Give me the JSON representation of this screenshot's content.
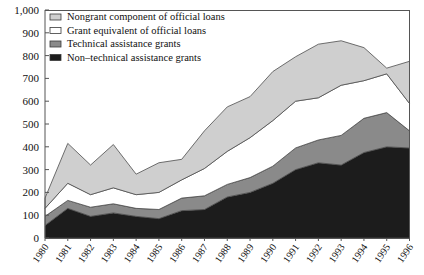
{
  "chart_data": {
    "type": "area",
    "stacked": true,
    "title": "",
    "subtitle": "",
    "xlabel": "",
    "ylabel": "",
    "grid": false,
    "legend_position": "top-left",
    "ylim": [
      0,
      1000
    ],
    "ytick_labels": [
      "1,000",
      "900",
      "800",
      "700",
      "600",
      "500",
      "400",
      "300",
      "200",
      "100",
      "0"
    ],
    "ytick_values": [
      1000,
      900,
      800,
      700,
      600,
      500,
      400,
      300,
      200,
      100,
      0
    ],
    "categories": [
      "1980",
      "1981",
      "1982",
      "1983",
      "1984",
      "1985",
      "1986",
      "1987",
      "1988",
      "1989",
      "1990",
      "1991",
      "1992",
      "1993",
      "1994",
      "1995",
      "1996"
    ],
    "x": [
      1980,
      1981,
      1982,
      1983,
      1984,
      1985,
      1986,
      1987,
      1988,
      1989,
      1990,
      1991,
      1992,
      1993,
      1994,
      1995,
      1996
    ],
    "series": [
      {
        "name": "Non-technical assistance grants",
        "color": "#1c1c1c",
        "values": [
          55,
          130,
          95,
          110,
          95,
          85,
          120,
          125,
          180,
          200,
          240,
          300,
          330,
          320,
          375,
          400,
          395
        ]
      },
      {
        "name": "Technical assistance grants",
        "color": "#8a8a8a",
        "values": [
          40,
          35,
          40,
          40,
          35,
          40,
          55,
          60,
          55,
          65,
          75,
          95,
          100,
          130,
          150,
          150,
          75
        ]
      },
      {
        "name": "Grant equivalent of official loans",
        "color": "#ffffff",
        "values": [
          35,
          75,
          55,
          70,
          60,
          75,
          80,
          120,
          145,
          175,
          200,
          205,
          185,
          220,
          165,
          170,
          120
        ]
      },
      {
        "name": "Nongrant component of official loans",
        "color": "#cfcfcf",
        "values": [
          45,
          175,
          130,
          190,
          90,
          130,
          90,
          165,
          195,
          180,
          215,
          195,
          235,
          195,
          145,
          25,
          185
        ]
      }
    ],
    "totals": [
      175,
      415,
      320,
      410,
      280,
      330,
      345,
      470,
      575,
      620,
      730,
      795,
      850,
      865,
      835,
      745,
      775
    ]
  },
  "legend": {
    "items": [
      {
        "label": "Nongrant component of official loans",
        "color": "#cfcfcf"
      },
      {
        "label": "Grant equivalent of official loans",
        "color": "#ffffff"
      },
      {
        "label": "Technical assistance grants",
        "color": "#8a8a8a"
      },
      {
        "label": "Non–technical assistance grants",
        "color": "#1c1c1c"
      }
    ]
  }
}
